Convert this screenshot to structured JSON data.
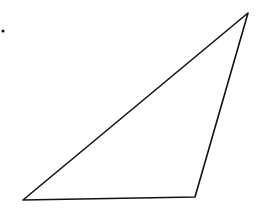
{
  "diagram": {
    "type": "triangle",
    "stroke_color": "#111111",
    "background": "#ffffff",
    "vertices": [
      {
        "name": "top-right",
        "x": 248,
        "y": 13
      },
      {
        "name": "bottom-left",
        "x": 23,
        "y": 200
      },
      {
        "name": "bottom-right",
        "x": 195,
        "y": 197
      }
    ],
    "marker_dot": {
      "x": 3,
      "y": 31
    }
  }
}
